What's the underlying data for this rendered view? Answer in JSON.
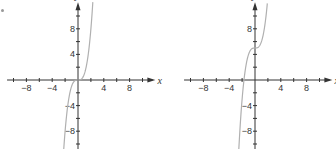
{
  "figure": {
    "marker": "."
  },
  "chart_data": [
    {
      "type": "line",
      "title": "",
      "function": "y = x^3",
      "xlabel": "x",
      "ylabel": "y",
      "xlim": [
        -11,
        12
      ],
      "ylim": [
        -12,
        12
      ],
      "x_ticks": [
        -10,
        -8,
        -6,
        -4,
        -2,
        0,
        2,
        4,
        6,
        8,
        10
      ],
      "x_tick_labels": [
        "-8",
        "-4",
        "4",
        "8"
      ],
      "y_ticks": [
        -10,
        -8,
        -6,
        -4,
        -2,
        0,
        2,
        4,
        6,
        8,
        10
      ],
      "y_tick_labels": [
        "8",
        "4",
        "-4",
        "-8"
      ],
      "grid": false,
      "series": [
        {
          "name": "curve",
          "x": [
            -2.3,
            -2,
            -1.5,
            -1,
            -0.5,
            0,
            0.5,
            1,
            1.5,
            2,
            2.3
          ],
          "y": [
            -12.17,
            -8,
            -3.375,
            -1,
            -0.125,
            0,
            0.125,
            1,
            3.375,
            8,
            12.17
          ]
        }
      ],
      "origin_px": [
        78,
        80
      ],
      "curve_color": "#b0b0b0",
      "axis_color": "#333333"
    },
    {
      "type": "line",
      "title": "",
      "function": "y = x^3 + 5",
      "xlabel": "x",
      "ylabel": "y",
      "xlim": [
        -11,
        12
      ],
      "ylim": [
        -12,
        12
      ],
      "x_ticks": [
        -10,
        -8,
        -6,
        -4,
        -2,
        0,
        2,
        4,
        6,
        8,
        10
      ],
      "x_tick_labels": [
        "-8",
        "-4",
        "4",
        "8"
      ],
      "y_ticks": [
        -10,
        -8,
        -6,
        -4,
        -2,
        0,
        2,
        4,
        6,
        8,
        10
      ],
      "y_tick_labels": [
        "8",
        "-4",
        "-8"
      ],
      "grid": false,
      "series": [
        {
          "name": "curve",
          "x": [
            -2.57,
            -2,
            -1.5,
            -1,
            -0.5,
            0,
            0.5,
            1,
            1.5,
            1.91
          ],
          "y": [
            -12,
            -3,
            1.625,
            4,
            4.875,
            5,
            5.125,
            6,
            8.375,
            12
          ]
        }
      ],
      "origin_px": [
        255,
        80
      ],
      "curve_color": "#b0b0b0",
      "axis_color": "#333333"
    }
  ]
}
